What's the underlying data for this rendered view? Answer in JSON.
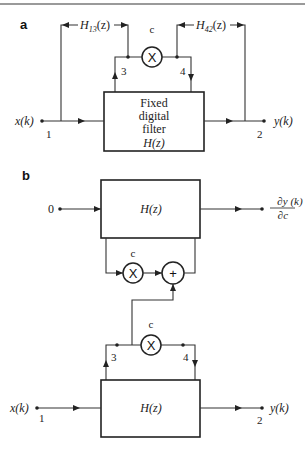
{
  "figure": {
    "panels": [
      {
        "label": "a",
        "block": {
          "line1": "Fixed",
          "line2": "digital",
          "line3": "filter",
          "line4": "H(z)"
        },
        "input": {
          "label": "x(k)",
          "node": "1"
        },
        "output": {
          "label": "y(k)",
          "node": "2"
        },
        "internal_nodes": {
          "left": "3",
          "right": "4"
        },
        "multiplier": {
          "symbol": "X",
          "coefficient": "c"
        },
        "transfer_left": {
          "name": "H",
          "sub": "13",
          "arg": "(z)"
        },
        "transfer_right": {
          "name": "H",
          "sub": "42",
          "arg": "(z)"
        }
      },
      {
        "label": "b",
        "sensitivity_block": {
          "label": "H(z)",
          "input": "0",
          "output": {
            "numerator": "∂y (k)",
            "denominator": "∂c"
          },
          "multiplier": {
            "symbol": "X",
            "coefficient": "c"
          },
          "adder": {
            "symbol": "+"
          }
        },
        "main_block": {
          "label": "H(z)",
          "input": {
            "label": "x(k)",
            "node": "1"
          },
          "output": {
            "label": "y(k)",
            "node": "2"
          },
          "internal_nodes": {
            "left": "3",
            "right": "4"
          },
          "multiplier": {
            "symbol": "X",
            "coefficient": "c"
          }
        }
      }
    ],
    "colors": {
      "line": "#333333",
      "background": "#ffffff"
    }
  }
}
